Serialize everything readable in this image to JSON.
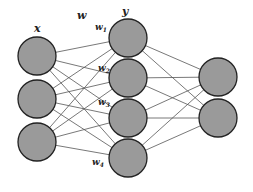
{
  "diagram": {
    "type": "feedforward-neural-network",
    "node_color": "#9a9a9a",
    "node_border": "#222222",
    "edge_color": "#555555",
    "layers": [
      {
        "name": "input",
        "label": "x",
        "count": 3
      },
      {
        "name": "hidden",
        "label": "y",
        "count": 4
      },
      {
        "name": "output",
        "label": "",
        "count": 2
      }
    ],
    "weight_label": "w",
    "weight_node_labels": [
      {
        "base": "w",
        "sub": "1"
      },
      {
        "base": "w",
        "sub": "2"
      },
      {
        "base": "w",
        "sub": "3"
      },
      {
        "base": "w",
        "sub": "4"
      }
    ],
    "connections": "fully-connected between consecutive layers"
  }
}
